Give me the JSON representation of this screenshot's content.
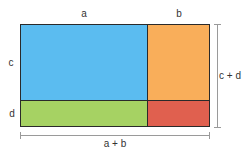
{
  "diagram": {
    "type": "area-model",
    "labels": {
      "top_a": "a",
      "top_b": "b",
      "left_c": "c",
      "left_d": "d",
      "right_total": "c + d",
      "bottom_total": "a + b"
    },
    "regions": [
      {
        "name": "a-by-c",
        "color": "#5bbcf0"
      },
      {
        "name": "b-by-c",
        "color": "#f9ae5a"
      },
      {
        "name": "a-by-d",
        "color": "#a6d263"
      },
      {
        "name": "b-by-d",
        "color": "#e0604f"
      }
    ],
    "colors": {
      "outline": "#2a2a2a",
      "dimension_line": "#9a9a9a",
      "text": "#333333"
    }
  }
}
